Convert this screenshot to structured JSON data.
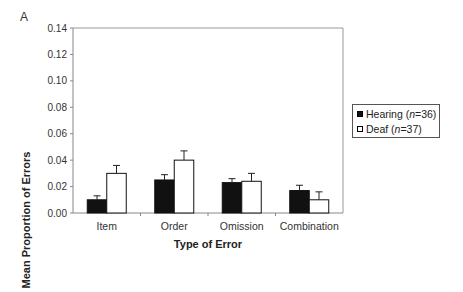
{
  "panel_label": "A",
  "chart_data": {
    "type": "bar",
    "title": "",
    "xlabel": "Type of Error",
    "ylabel": "Mean Proportion of Errors",
    "categories": [
      "Item",
      "Order",
      "Omission",
      "Combination"
    ],
    "ylim": [
      0,
      0.14
    ],
    "yticks": [
      "0.00",
      "0.02",
      "0.04",
      "0.06",
      "0.08",
      "0.10",
      "0.12",
      "0.14"
    ],
    "grid": false,
    "legend_position": "right",
    "series": [
      {
        "name": "Hearing (n=36)",
        "name_prefix": "Hearing (",
        "name_n": "n",
        "name_suffix": "=36)",
        "fill": "#111111",
        "values": [
          0.01,
          0.025,
          0.023,
          0.017
        ],
        "error": [
          0.003,
          0.004,
          0.003,
          0.004
        ]
      },
      {
        "name": "Deaf (n=37)",
        "name_prefix": "Deaf (",
        "name_n": "n",
        "name_suffix": "=37)",
        "fill": "#ffffff",
        "values": [
          0.03,
          0.04,
          0.024,
          0.01
        ],
        "error": [
          0.006,
          0.007,
          0.006,
          0.006
        ]
      }
    ]
  }
}
